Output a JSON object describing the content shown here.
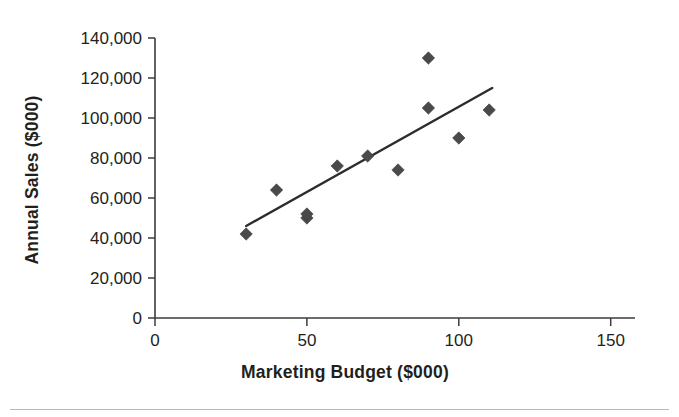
{
  "chart_data": {
    "type": "scatter",
    "title": "",
    "xlabel": "Marketing Budget ($000)",
    "ylabel": "Annual Sales ($000)",
    "xlim": [
      0,
      158
    ],
    "ylim": [
      0,
      140000
    ],
    "xticks": [
      0,
      50,
      100,
      150
    ],
    "xtick_labels": [
      "0",
      "50",
      "100",
      "150"
    ],
    "yticks": [
      0,
      20000,
      40000,
      60000,
      80000,
      100000,
      120000,
      140000
    ],
    "ytick_labels": [
      "0",
      "20,000",
      "40,000",
      "60,000",
      "80,000",
      "100,000",
      "120,000",
      "140,000"
    ],
    "grid": false,
    "legend": false,
    "marker": "diamond",
    "marker_color": "#4a4a4a",
    "line_color": "#2d2d2d",
    "points": [
      {
        "x": 30,
        "y": 42000
      },
      {
        "x": 40,
        "y": 64000
      },
      {
        "x": 50,
        "y": 50000
      },
      {
        "x": 50,
        "y": 52000
      },
      {
        "x": 60,
        "y": 76000
      },
      {
        "x": 70,
        "y": 81000
      },
      {
        "x": 80,
        "y": 74000
      },
      {
        "x": 90,
        "y": 105000
      },
      {
        "x": 90,
        "y": 130000
      },
      {
        "x": 100,
        "y": 90000
      },
      {
        "x": 110,
        "y": 104000
      }
    ],
    "trendline": {
      "name": "linear fit",
      "x_start": 30,
      "y_start": 46000,
      "x_end": 111,
      "y_end": 115000
    }
  }
}
